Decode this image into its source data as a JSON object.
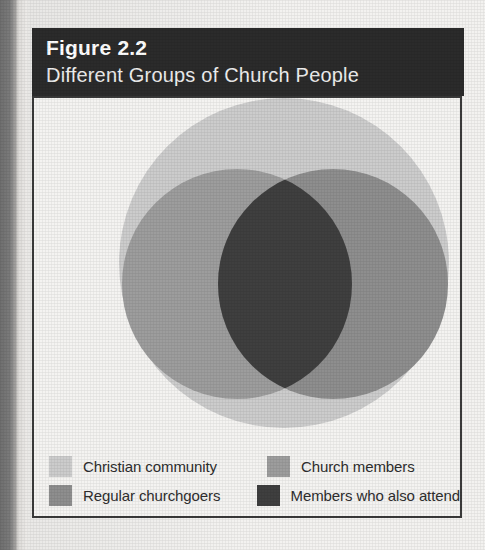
{
  "figure": {
    "number": "Figure 2.2",
    "title": "Different Groups of Church People",
    "header_bg": "#2b2b2b",
    "header_text_color": "#ffffff",
    "frame_border_color": "#3a3a3a",
    "page_bg": "#f3f2f0"
  },
  "legend": {
    "rows": [
      {
        "entries": [
          {
            "label": "Christian community",
            "color": "#cccccc",
            "swatch_name": "swatch-christian-community"
          },
          {
            "label": "Church members",
            "color": "#9d9d9d",
            "swatch_name": "swatch-church-members"
          }
        ]
      },
      {
        "entries": [
          {
            "label": "Regular churchgoers",
            "color": "#8e8e8e",
            "swatch_name": "swatch-regular-churchgoers"
          },
          {
            "label": "Members who also attend",
            "color": "#3f3f3f",
            "swatch_name": "swatch-members-who-also-attend"
          }
        ]
      }
    ]
  },
  "chart_data": {
    "type": "venn",
    "title": "Different Groups of Church People",
    "subtitle": "Figure 2.2",
    "grid": false,
    "legend_position": "bottom",
    "sets": [
      {
        "name": "Christian community",
        "shape": "circle",
        "cx": 250,
        "cy": 165,
        "r": 165,
        "color": "#cccccc",
        "role": "outer-universe"
      },
      {
        "name": "Church members",
        "shape": "circle",
        "cx": 203,
        "cy": 186,
        "r": 115,
        "color": "#9d9d9d",
        "role": "left-circle"
      },
      {
        "name": "Regular churchgoers",
        "shape": "circle",
        "cx": 299,
        "cy": 186,
        "r": 115,
        "color": "#8e8e8e",
        "role": "right-circle"
      }
    ],
    "intersections": [
      {
        "name": "Members who also attend",
        "of": [
          "Church members",
          "Regular churchgoers"
        ],
        "color": "#3f3f3f"
      }
    ],
    "annotations": []
  }
}
